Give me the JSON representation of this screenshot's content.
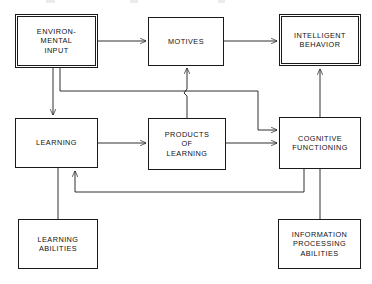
{
  "diagram": {
    "type": "flowchart",
    "title": "",
    "canvas": {
      "width": 372,
      "height": 284,
      "background": "#ffffff"
    },
    "stroke_color": "#1a1a1a",
    "text_color": "#111111",
    "nodes": [
      {
        "id": "environmental-input",
        "label": "ENVIRON-\nMENTAL\nINPUT",
        "x": 15,
        "y": 14,
        "w": 83,
        "h": 54,
        "emphasis": true
      },
      {
        "id": "motives",
        "label": "MOTIVES",
        "x": 148,
        "y": 17,
        "w": 76,
        "h": 49,
        "emphasis": false
      },
      {
        "id": "intelligent-behavior",
        "label": "INTELLIGENT\nBEHAVIOR",
        "x": 279,
        "y": 14,
        "w": 82,
        "h": 52,
        "emphasis": true
      },
      {
        "id": "learning",
        "label": "LEARNING",
        "x": 15,
        "y": 118,
        "w": 83,
        "h": 50,
        "emphasis": false
      },
      {
        "id": "products-of-learning",
        "label": "PRODUCTS\nOF\nLEARNING",
        "x": 148,
        "y": 118,
        "w": 78,
        "h": 52,
        "emphasis": false
      },
      {
        "id": "cognitive-functioning",
        "label": "COGNITIVE\nFUNCTIONING",
        "x": 279,
        "y": 117,
        "w": 82,
        "h": 52,
        "emphasis": false
      },
      {
        "id": "learning-abilities",
        "label": "LEARNING\nABILITIES",
        "x": 18,
        "y": 219,
        "w": 80,
        "h": 50,
        "emphasis": false
      },
      {
        "id": "information-processing-abilities",
        "label": "INFORMATION\nPROCESSING\nABILITIES",
        "x": 278,
        "y": 219,
        "w": 83,
        "h": 50,
        "emphasis": false
      }
    ],
    "edges": [
      {
        "id": "env-input-to-motives",
        "from": "environmental-input",
        "to": "motives",
        "arrow": true
      },
      {
        "id": "motives-to-intelligent-behavior",
        "from": "motives",
        "to": "intelligent-behavior",
        "arrow": true
      },
      {
        "id": "env-input-to-learning",
        "from": "environmental-input",
        "to": "learning",
        "arrow": true
      },
      {
        "id": "env-input-to-cognitive-functioning",
        "from": "environmental-input",
        "to": "cognitive-functioning",
        "arrow": true
      },
      {
        "id": "learning-to-products-of-learning",
        "from": "learning",
        "to": "products-of-learning",
        "arrow": true
      },
      {
        "id": "products-of-learning-to-cognitive-functioning",
        "from": "products-of-learning",
        "to": "cognitive-functioning",
        "arrow": true
      },
      {
        "id": "products-of-learning-to-motives",
        "from": "products-of-learning",
        "to": "motives",
        "arrow": true
      },
      {
        "id": "cognitive-functioning-to-intelligent-behavior",
        "from": "cognitive-functioning",
        "to": "intelligent-behavior",
        "arrow": true
      },
      {
        "id": "cognitive-functioning-to-learning",
        "from": "cognitive-functioning",
        "to": "learning",
        "arrow": true
      },
      {
        "id": "learning-abilities-to-learning",
        "from": "learning-abilities",
        "to": "learning",
        "arrow": false
      },
      {
        "id": "information-processing-abilities-to-cognitive-functioning",
        "from": "information-processing-abilities",
        "to": "cognitive-functioning",
        "arrow": false
      }
    ]
  }
}
